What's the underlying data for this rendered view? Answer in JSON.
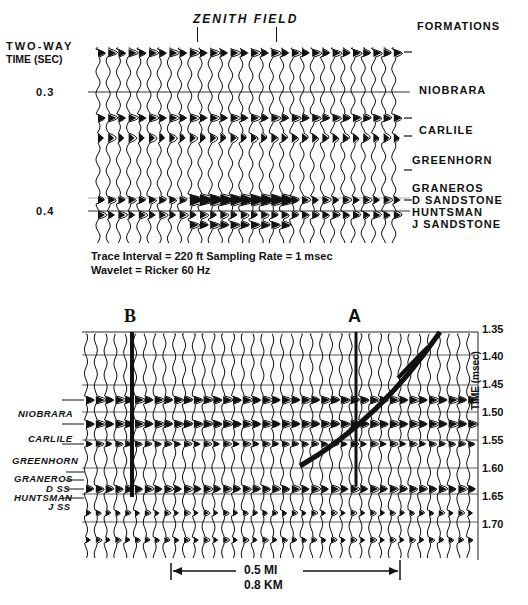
{
  "top_panel": {
    "title": "ZENITH FIELD",
    "axis_label_line1": "TWO-WAY",
    "axis_label_line2": "TIME (SEC)",
    "time_ticks": [
      {
        "label": "0.3"
      },
      {
        "label": "0.4"
      }
    ],
    "formations_header": "FORMATIONS",
    "formations": [
      {
        "name": "NIOBRARA"
      },
      {
        "name": "CARLILE"
      },
      {
        "name": "GREENHORN"
      },
      {
        "name": "GRANEROS"
      },
      {
        "name": "D SANDSTONE"
      },
      {
        "name": "HUNTSMAN"
      },
      {
        "name": "J SANDSTONE"
      }
    ],
    "caption_line1": "Trace Interval = 220 ft   Sampling Rate = 1 msec",
    "caption_line2": "Wavelet = Ricker 60 Hz"
  },
  "bottom_panel": {
    "marker_b": "B",
    "marker_a": "A",
    "formations": [
      {
        "name": "NIOBRARA"
      },
      {
        "name": "CARLILE"
      },
      {
        "name": "GREENHORN"
      },
      {
        "name": "GRANEROS"
      },
      {
        "name": "D SS"
      },
      {
        "name": "HUNTSMAN"
      },
      {
        "name": "J SS"
      }
    ],
    "time_axis_label": "TIME (msec)",
    "time_ticks": [
      {
        "label": "1.35"
      },
      {
        "label": "1.40"
      },
      {
        "label": "1.45"
      },
      {
        "label": "1.50"
      },
      {
        "label": "1.55"
      },
      {
        "label": "1.60"
      },
      {
        "label": "1.65"
      },
      {
        "label": "1.70"
      }
    ],
    "scale_line1": "0.5 MI",
    "scale_line2": "0.8 KM"
  },
  "colors": {
    "ink": "#111111",
    "background": "#ffffff",
    "grid": "#444444"
  }
}
